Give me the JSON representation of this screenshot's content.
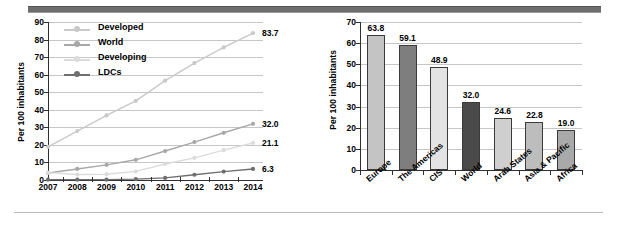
{
  "decor": {
    "top_rule_color": "#6d6d6d",
    "bottom_rule_color": "#b9b9b9"
  },
  "chart_data": [
    {
      "id": "line-chart",
      "type": "line",
      "title": "",
      "xlabel": "",
      "ylabel": "Per 100 inhabitants",
      "x": [
        "2007",
        "2008",
        "2009",
        "2010",
        "2011",
        "2012",
        "2013",
        "2014"
      ],
      "ylim": [
        0,
        90
      ],
      "yticks": [
        0,
        10,
        20,
        30,
        40,
        50,
        60,
        70,
        80,
        90
      ],
      "grid": true,
      "legend_position": "top-left",
      "series": [
        {
          "name": "Developed",
          "color": "#c9c9c9",
          "values": [
            18.9,
            27.9,
            36.8,
            45.1,
            56.6,
            66.6,
            75.5,
            83.7
          ],
          "end_label": "83.7"
        },
        {
          "name": "World",
          "color": "#a8a8a8",
          "values": [
            4.0,
            6.3,
            8.6,
            11.5,
            16.5,
            21.6,
            26.9,
            32.0
          ],
          "end_label": "32.0"
        },
        {
          "name": "Developing",
          "color": "#dcdcdc",
          "values": [
            4.2,
            3.1,
            3.3,
            4.9,
            9.1,
            12.6,
            17.0,
            21.1
          ],
          "end_label": "21.1"
        },
        {
          "name": "LDCs",
          "color": "#6f6f6f",
          "values": [
            0.2,
            0.2,
            0.2,
            0.5,
            1.2,
            3.0,
            4.8,
            6.3
          ],
          "end_label": "6.3"
        }
      ]
    },
    {
      "id": "bar-chart",
      "type": "bar",
      "title": "",
      "xlabel": "",
      "ylabel": "Per 100 inhabitants",
      "categories": [
        "Europe",
        "The Americas",
        "CIS",
        "World",
        "Arab States",
        "Asia & Pacific",
        "Africa"
      ],
      "values": [
        63.8,
        59.1,
        48.9,
        32.0,
        24.6,
        22.8,
        19.0
      ],
      "value_labels": [
        "63.8",
        "59.1",
        "48.9",
        "32.0",
        "24.6",
        "22.8",
        "19.0"
      ],
      "colors": [
        "#c4c4c4",
        "#7e7e7e",
        "#e3e3e3",
        "#4a4a4a",
        "#cfcfcf",
        "#bdbdbd",
        "#a9a9a9"
      ],
      "ylim": [
        0,
        70
      ],
      "yticks": [
        0,
        10,
        20,
        30,
        40,
        50,
        60,
        70
      ],
      "grid": true
    }
  ]
}
